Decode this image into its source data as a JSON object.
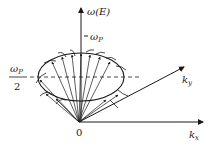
{
  "diagram": {
    "title": "",
    "axes": {
      "vertical_label": "ω(E)",
      "kx_label": "k",
      "kx_sub": "x",
      "ky_label": "k",
      "ky_sub": "y",
      "origin_label": "0"
    },
    "ticks": {
      "omega_p_label": "ω",
      "omega_p_sub": "P",
      "half_numerator": "ω",
      "half_numerator_sub": "P",
      "half_denominator": "2"
    },
    "colors": {
      "stroke": "#1a1a1a",
      "background": "#ffffff"
    },
    "cone": {
      "ellipse_center": [
        81,
        77
      ],
      "ellipse_rx": 43,
      "ellipse_ry": 24,
      "apex": [
        79,
        122
      ],
      "arrow_count": 12
    }
  }
}
